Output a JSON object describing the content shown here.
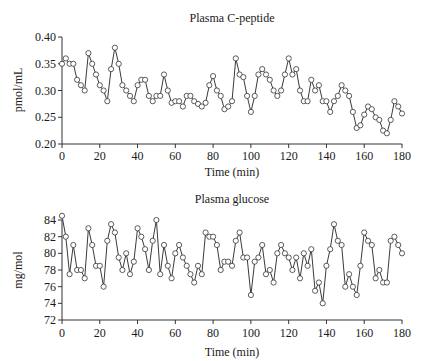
{
  "chart_data": [
    {
      "type": "line",
      "title": "Plasma C-peptide",
      "xlabel": "Time (min)",
      "ylabel": "pmol/mL",
      "xlim": [
        0,
        180
      ],
      "ylim": [
        0.2,
        0.4
      ],
      "xticks": [
        0,
        20,
        40,
        60,
        80,
        100,
        120,
        140,
        160,
        180
      ],
      "yticks": [
        0.2,
        0.25,
        0.3,
        0.35,
        0.4
      ],
      "ytick_labels": [
        "0.20",
        "0.25",
        "0.30",
        "0.35",
        "0.40"
      ],
      "grid": false,
      "legend": null,
      "marker": "open-circle",
      "x": [
        0,
        2,
        4,
        6,
        8,
        10,
        12,
        14,
        16,
        18,
        20,
        22,
        24,
        26,
        28,
        30,
        32,
        34,
        36,
        38,
        40,
        42,
        44,
        46,
        48,
        50,
        52,
        54,
        56,
        58,
        60,
        62,
        64,
        66,
        68,
        70,
        72,
        74,
        76,
        78,
        80,
        82,
        84,
        86,
        88,
        90,
        92,
        94,
        96,
        98,
        100,
        102,
        104,
        106,
        108,
        110,
        112,
        114,
        116,
        118,
        120,
        122,
        124,
        126,
        128,
        130,
        132,
        134,
        136,
        138,
        140,
        142,
        144,
        146,
        148,
        150,
        152,
        154,
        156,
        158,
        160,
        162,
        164,
        166,
        168,
        170,
        172,
        174,
        176,
        178,
        180
      ],
      "series": [
        {
          "name": "C-peptide",
          "values": [
            0.35,
            0.36,
            0.35,
            0.35,
            0.32,
            0.31,
            0.3,
            0.37,
            0.35,
            0.33,
            0.31,
            0.3,
            0.28,
            0.34,
            0.38,
            0.35,
            0.31,
            0.3,
            0.29,
            0.28,
            0.31,
            0.32,
            0.32,
            0.29,
            0.28,
            0.29,
            0.29,
            0.33,
            0.3,
            0.277,
            0.28,
            0.28,
            0.27,
            0.29,
            0.29,
            0.28,
            0.275,
            0.27,
            0.277,
            0.31,
            0.327,
            0.3,
            0.29,
            0.265,
            0.27,
            0.28,
            0.36,
            0.33,
            0.325,
            0.29,
            0.26,
            0.29,
            0.33,
            0.34,
            0.33,
            0.32,
            0.3,
            0.29,
            0.3,
            0.33,
            0.36,
            0.33,
            0.34,
            0.3,
            0.28,
            0.28,
            0.32,
            0.3,
            0.31,
            0.28,
            0.28,
            0.26,
            0.28,
            0.29,
            0.31,
            0.3,
            0.29,
            0.26,
            0.23,
            0.235,
            0.255,
            0.27,
            0.265,
            0.25,
            0.245,
            0.225,
            0.22,
            0.245,
            0.28,
            0.27,
            0.257
          ]
        }
      ]
    },
    {
      "type": "line",
      "title": "Plasma glucose",
      "xlabel": "Time (min)",
      "ylabel": "mg/mol",
      "xlim": [
        0,
        180
      ],
      "ylim": [
        72,
        84
      ],
      "xticks": [
        0,
        20,
        40,
        60,
        80,
        100,
        120,
        140,
        160,
        180
      ],
      "yticks": [
        72,
        74,
        76,
        78,
        80,
        82,
        84
      ],
      "ytick_labels": [
        "72",
        "74",
        "76",
        "78",
        "80",
        "82",
        "84"
      ],
      "grid": false,
      "legend": null,
      "marker": "open-circle",
      "x": [
        0,
        2,
        4,
        6,
        8,
        10,
        12,
        14,
        16,
        18,
        20,
        22,
        24,
        26,
        28,
        30,
        32,
        34,
        36,
        38,
        40,
        42,
        44,
        46,
        48,
        50,
        52,
        54,
        56,
        58,
        60,
        62,
        64,
        66,
        68,
        70,
        72,
        74,
        76,
        78,
        80,
        82,
        84,
        86,
        88,
        90,
        92,
        94,
        96,
        98,
        100,
        102,
        104,
        106,
        108,
        110,
        112,
        114,
        116,
        118,
        120,
        122,
        124,
        126,
        128,
        130,
        132,
        134,
        136,
        138,
        140,
        142,
        144,
        146,
        148,
        150,
        152,
        154,
        156,
        158,
        160,
        162,
        164,
        166,
        168,
        170,
        172,
        174,
        176,
        178,
        180
      ],
      "series": [
        {
          "name": "Glucose",
          "values": [
            84.5,
            82,
            77.5,
            81,
            78,
            78,
            77,
            83,
            81,
            78.5,
            78.5,
            76,
            81.5,
            83.5,
            82.5,
            79.5,
            78,
            80,
            77.5,
            79,
            83,
            82,
            80.5,
            78,
            81.5,
            84,
            77.5,
            81,
            78.5,
            77,
            80,
            81,
            79.5,
            78.5,
            77.5,
            76.5,
            78.5,
            77.5,
            82.5,
            82,
            82,
            81,
            78,
            79,
            79,
            78.5,
            81.5,
            82.5,
            79.5,
            79.5,
            75,
            79,
            79.5,
            81,
            77.5,
            78,
            76.5,
            80,
            81,
            80,
            79.5,
            78,
            79.5,
            77,
            80,
            78.5,
            80.5,
            75.5,
            76.5,
            74,
            78.5,
            80.5,
            83.5,
            81.5,
            81,
            76,
            77.5,
            76,
            75,
            78.5,
            82.5,
            81.5,
            81,
            77,
            78,
            76.5,
            76.5,
            81.5,
            82,
            81,
            80
          ]
        }
      ]
    }
  ]
}
